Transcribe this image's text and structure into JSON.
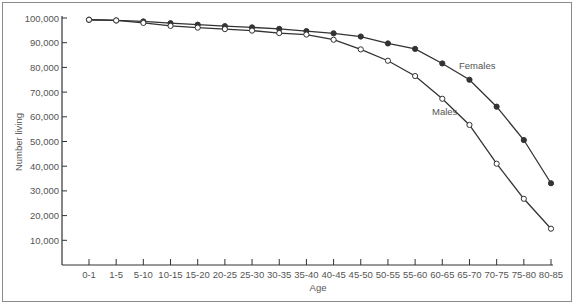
{
  "chart_data": {
    "type": "line",
    "title": "",
    "xlabel": "Age",
    "ylabel": "Number living",
    "ylim": [
      0,
      100000
    ],
    "yticks": [
      10000,
      20000,
      30000,
      40000,
      50000,
      60000,
      70000,
      80000,
      90000,
      100000
    ],
    "ytick_labels": [
      "10,000",
      "20,000",
      "30,000",
      "40,000",
      "50,000",
      "60,000",
      "70,000",
      "80,000",
      "90,000",
      "100,000"
    ],
    "grid": false,
    "legend": "inline labels",
    "categories": [
      "0-1",
      "1-5",
      "5-10",
      "10-15",
      "15-20",
      "20-25",
      "25-30",
      "30-35",
      "35-40",
      "40-45",
      "45-50",
      "50-55",
      "55-60",
      "60-65",
      "65-70",
      "70-75",
      "75-80",
      "80-85"
    ],
    "series": [
      {
        "name": "Females",
        "marker": "filled-circle",
        "values": [
          99300,
          99000,
          98600,
          97900,
          97300,
          96700,
          96200,
          95600,
          94700,
          93800,
          92500,
          89700,
          87500,
          81600,
          75000,
          64100,
          50600,
          33100
        ]
      },
      {
        "name": "Males",
        "marker": "open-circle",
        "values": [
          99300,
          99000,
          98000,
          96800,
          96100,
          95500,
          94900,
          93900,
          93300,
          91200,
          87300,
          82700,
          76500,
          67300,
          56700,
          41000,
          26800,
          14700
        ]
      }
    ]
  },
  "labels": {
    "females": "Females",
    "males": "Males",
    "x_axis": "Age",
    "y_axis": "Number living"
  }
}
